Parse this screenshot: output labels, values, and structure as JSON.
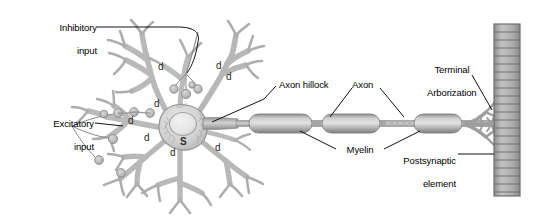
{
  "figure": {
    "background": "#ffffff",
    "width": 534,
    "height": 217
  },
  "colors": {
    "outline": "#8e8e8e",
    "membrane_fill": "#c9c9c9",
    "dendrite_fill": "#c4c4c4",
    "soma_fill": "#d4d4d4",
    "nucleus_fill": "#e6e6e6",
    "myelin_dark": "#8f8f8f",
    "myelin_light": "#d9d9d9",
    "axon_fill": "#a8a8a8",
    "postsynaptic_fill": "#a9a9a9",
    "postsynaptic_stripe": "#6e6e6e",
    "leader_line": "#111111",
    "label_text": "#000000"
  },
  "labels": {
    "inhibitory_input": {
      "line1": "Inhibitory",
      "line2": "input"
    },
    "excitatory_input": {
      "line1": "Excitatory",
      "line2": "input"
    },
    "axon_hillock": "Axon hillock",
    "axon": "Axon",
    "myelin": "Myelin",
    "terminal_arborization": {
      "line1": "Terminal",
      "line2": "Arborization"
    },
    "postsynaptic_element": {
      "line1": "Postsynaptic",
      "line2": "element"
    }
  },
  "annotations": {
    "soma_marker": "S",
    "dendrite_marker": "d",
    "dendrite_markers": [
      {
        "text": "d",
        "x": 158,
        "y": 62
      },
      {
        "text": "d",
        "x": 216,
        "y": 61
      },
      {
        "text": "d",
        "x": 226,
        "y": 72
      },
      {
        "text": "d",
        "x": 154,
        "y": 99
      },
      {
        "text": "d",
        "x": 144,
        "y": 133
      },
      {
        "text": "d",
        "x": 215,
        "y": 143
      },
      {
        "text": "d",
        "x": 170,
        "y": 148
      },
      {
        "text": "d",
        "x": 128,
        "y": 116
      }
    ],
    "soma_marker_pos": {
      "x": 180,
      "y": 137
    }
  },
  "structures": {
    "dendritic_tree": "branching dendrites radiating from soma",
    "soma": "cell body with nucleus",
    "axon_hillock": "tapered origin of axon at soma",
    "axon": "long process extending right",
    "myelin_segments": 4,
    "nodes_of_ranvier": 3,
    "terminal_arborization": "fan of terminal branches",
    "postsynaptic_element": "striped vertical bar target cell",
    "postsynaptic_stripe_count": 22,
    "inhibitory_boutons": 4,
    "excitatory_boutons": 7
  },
  "chart_data": {
    "type": "diagram",
    "parts": [
      {
        "name": "Inhibitory input",
        "target": "soma",
        "synapse_type": "inhibitory"
      },
      {
        "name": "Excitatory input",
        "target": "dendrites",
        "synapse_type": "excitatory"
      },
      {
        "name": "Axon hillock",
        "target": "axon origin"
      },
      {
        "name": "Axon",
        "target": "axon shaft"
      },
      {
        "name": "Myelin",
        "target": "myelin sheath segments"
      },
      {
        "name": "Terminal Arborization",
        "target": "axon terminals"
      },
      {
        "name": "Postsynaptic element",
        "target": "target cell membrane"
      },
      {
        "name": "d",
        "target": "dendrite",
        "count": 8
      },
      {
        "name": "S",
        "target": "soma",
        "count": 1
      }
    ]
  }
}
